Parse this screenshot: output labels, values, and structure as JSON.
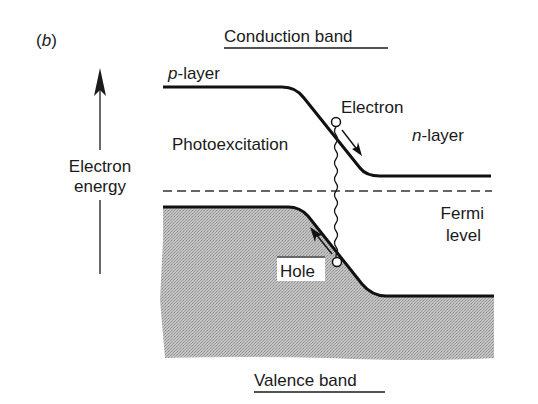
{
  "figure": {
    "panel_label": "(b)",
    "panel_letter": "b",
    "title_top": "Conduction band",
    "title_bottom": "Valence band"
  },
  "axis": {
    "label_line1": "Electron",
    "label_line2": "energy",
    "direction": "up-arrow-icon"
  },
  "labels": {
    "p_layer_prefix": "p",
    "p_layer_suffix": "-layer",
    "n_layer_prefix": "n",
    "n_layer_suffix": "-layer",
    "photoexcitation": "Photoexcitation",
    "electron": "Electron",
    "hole": "Hole",
    "fermi_line1": "Fermi",
    "fermi_line2": "level"
  },
  "colors": {
    "ink": "#1a1a1a",
    "shade": "#b8b8b8",
    "background": "#ffffff"
  }
}
